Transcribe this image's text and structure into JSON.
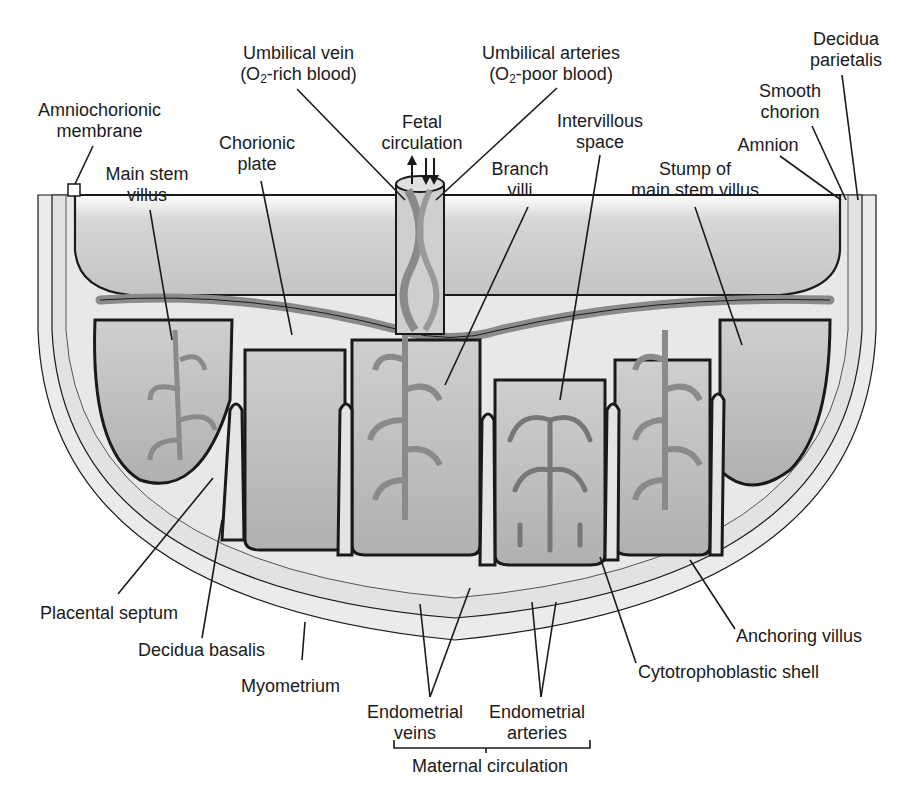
{
  "diagram": {
    "colors": {
      "amniotic_cavity": "#c9c9c9",
      "cotyledon": "#bdbdbd",
      "decidua": "#e4e4e4",
      "myometrium": "#ececec",
      "vessel": "#8a8a8a",
      "outline": "#1a1a1a",
      "background": "#ffffff"
    },
    "labels": {
      "umbilical_vein": {
        "line1": "Umbilical vein",
        "line2_pre": "(O",
        "line2_sub": "2",
        "line2_post": "-rich blood)"
      },
      "umbilical_arteries": {
        "line1": "Umbilical arteries",
        "line2_pre": "(O",
        "line2_sub": "2",
        "line2_post": "-poor blood)"
      },
      "decidua_parietalis": {
        "line1": "Decidua",
        "line2": "parietalis"
      },
      "amniochorionic_membrane": {
        "line1": "Amniochorionic",
        "line2": "membrane"
      },
      "fetal_circulation": {
        "line1": "Fetal",
        "line2": "circulation"
      },
      "intervillous_space": {
        "line1": "Intervillous",
        "line2": "space"
      },
      "smooth_chorion": {
        "line1": "Smooth",
        "line2": "chorion"
      },
      "chorionic_plate": {
        "line1": "Chorionic",
        "line2": "plate"
      },
      "main_stem_villus": {
        "line1": "Main stem",
        "line2": "villus"
      },
      "branch_villi": {
        "line1": "Branch",
        "line2": "villi"
      },
      "amnion": "Amnion",
      "stump_of_main_stem_villus": {
        "line1": "Stump of",
        "line2": "main stem villus"
      },
      "placental_septum": "Placental septum",
      "decidua_basalis": "Decidua basalis",
      "myometrium": "Myometrium",
      "anchoring_villus": "Anchoring villus",
      "cytotrophoblastic_shell": "Cytotrophoblastic shell",
      "endometrial_veins": {
        "line1": "Endometrial",
        "line2": "veins"
      },
      "endometrial_arteries": {
        "line1": "Endometrial",
        "line2": "arteries"
      },
      "maternal_circulation": "Maternal circulation"
    }
  }
}
